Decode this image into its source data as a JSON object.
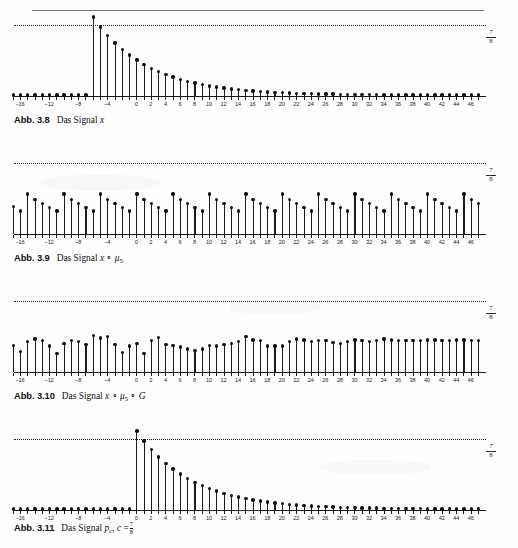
{
  "page": {
    "header_ghost": "",
    "background_color": "#fefefe",
    "ink_color": "#1b1b1b"
  },
  "reference_value_label": {
    "numerator": "7",
    "denominator": "8"
  },
  "figures": [
    {
      "id": "abb-3-8",
      "label": "Abb. 3.8",
      "caption_prefix": "Das Signal",
      "caption_math": "x",
      "caption_full": "Abb. 3.8  Das Signal x"
    },
    {
      "id": "abb-3-9",
      "label": "Abb. 3.9",
      "caption_prefix": "Das Signal",
      "caption_math": "x ∘ μ5",
      "caption_full": "Abb. 3.9  Das Signal x ∘ μ₅"
    },
    {
      "id": "abb-3-10",
      "label": "Abb. 3.10",
      "caption_prefix": "Das Signal",
      "caption_math": "x ∘ μ5 ∘ G",
      "caption_full": "Abb. 3.10  Das Signal x ∘ μ₅ ∘ G"
    },
    {
      "id": "abb-3-11",
      "label": "Abb. 3.11",
      "caption_prefix": "Das Signal",
      "caption_math": "pc, c = 7/8",
      "caption_full": "Abb. 3.11  Das Signal p_c, c = 7/8"
    }
  ],
  "axis": {
    "x_min": -17,
    "x_max": 47,
    "tick_step": 1,
    "labeled_ticks": [
      -16,
      -12,
      -8,
      -4,
      0,
      2,
      4,
      6,
      8,
      10,
      12,
      14,
      16,
      18,
      20,
      22,
      24,
      26,
      28,
      30,
      32,
      34,
      36,
      38,
      40,
      42,
      44,
      46
    ],
    "tick_labels": [
      "−16",
      "−12",
      "−8",
      "−4",
      "0",
      "2",
      "4",
      "6",
      "8",
      "10",
      "12",
      "14",
      "16",
      "18",
      "20",
      "22",
      "24",
      "26",
      "28",
      "30",
      "32",
      "34",
      "36",
      "38",
      "40",
      "42",
      "44",
      "46"
    ],
    "y_max": 0.875,
    "y_reference_line": 0.875
  },
  "chart_data": [
    {
      "type": "line",
      "plot_style": "stem",
      "title": "Abb. 3.8 Das Signal x",
      "xlabel": "",
      "ylabel": "",
      "ylim": [
        0,
        0.875
      ],
      "xlim": [
        -17,
        47
      ],
      "grid": false,
      "legend": "none",
      "annotations": [
        "7/8 reference dotted line"
      ],
      "x": [
        -17,
        -16,
        -15,
        -14,
        -13,
        -12,
        -11,
        -10,
        -9,
        -8,
        -7,
        -6,
        -5,
        -4,
        -3,
        -2,
        -1,
        0,
        1,
        2,
        3,
        4,
        5,
        6,
        7,
        8,
        9,
        10,
        11,
        12,
        13,
        14,
        15,
        16,
        17,
        18,
        19,
        20,
        21,
        22,
        23,
        24,
        25,
        26,
        27,
        28,
        29,
        30,
        31,
        32,
        33,
        34,
        35,
        36,
        37,
        38,
        39,
        40,
        41,
        42,
        43,
        44,
        45,
        46,
        47
      ],
      "values": [
        0,
        0,
        0,
        0,
        0,
        0,
        0,
        0,
        0,
        0,
        0,
        0.875,
        0.766,
        0.67,
        0.586,
        0.513,
        0.449,
        0.393,
        0.344,
        0.301,
        0.263,
        0.23,
        0.201,
        0.176,
        0.154,
        0.135,
        0.118,
        0.103,
        0.09,
        0.079,
        0.069,
        0.06,
        0.053,
        0.046,
        0.04,
        0.035,
        0.031,
        0.027,
        0.024,
        0.021,
        0.018,
        0.016,
        0.014,
        0.012,
        0.011,
        0.009,
        0.008,
        0.007,
        0.006,
        0.005,
        0.005,
        0.004,
        0.004,
        0.003,
        0.003,
        0.002,
        0.002,
        0.002,
        0.002,
        0.001,
        0.001,
        0.001,
        0.001,
        0.001,
        0.001
      ]
    },
    {
      "type": "line",
      "plot_style": "stem",
      "title": "Abb. 3.9 Das Signal x ∘ μ₅",
      "xlabel": "",
      "ylabel": "",
      "ylim": [
        0,
        0.875
      ],
      "xlim": [
        -17,
        47
      ],
      "grid": false,
      "legend": "none",
      "annotations": [
        "7/8 reference dotted line",
        "periodic with period 5"
      ],
      "x": [
        -17,
        -16,
        -15,
        -14,
        -13,
        -12,
        -11,
        -10,
        -9,
        -8,
        -7,
        -6,
        -5,
        -4,
        -3,
        -2,
        -1,
        0,
        1,
        2,
        3,
        4,
        5,
        6,
        7,
        8,
        9,
        10,
        11,
        12,
        13,
        14,
        15,
        16,
        17,
        18,
        19,
        20,
        21,
        22,
        23,
        24,
        25,
        26,
        27,
        28,
        29,
        30,
        31,
        32,
        33,
        34,
        35,
        36,
        37,
        38,
        39,
        40,
        41,
        42,
        43,
        44,
        45,
        46,
        47
      ],
      "values": [
        0.3,
        0.25,
        0.44,
        0.38,
        0.33,
        0.29,
        0.25,
        0.44,
        0.38,
        0.33,
        0.29,
        0.25,
        0.44,
        0.38,
        0.33,
        0.29,
        0.25,
        0.44,
        0.38,
        0.33,
        0.29,
        0.25,
        0.44,
        0.38,
        0.33,
        0.29,
        0.25,
        0.44,
        0.38,
        0.33,
        0.29,
        0.25,
        0.44,
        0.38,
        0.33,
        0.29,
        0.25,
        0.44,
        0.38,
        0.33,
        0.29,
        0.25,
        0.44,
        0.38,
        0.33,
        0.29,
        0.25,
        0.44,
        0.38,
        0.33,
        0.29,
        0.25,
        0.44,
        0.38,
        0.33,
        0.29,
        0.25,
        0.44,
        0.38,
        0.33,
        0.29,
        0.25,
        0.44,
        0.38,
        0.33
      ]
    },
    {
      "type": "line",
      "plot_style": "stem",
      "title": "Abb. 3.10 Das Signal x ∘ μ₅ ∘ G",
      "xlabel": "",
      "ylabel": "",
      "ylim": [
        0,
        0.875
      ],
      "xlim": [
        -17,
        47
      ],
      "grid": false,
      "legend": "none",
      "annotations": [
        "7/8 reference dotted line",
        "quasi-random modulated pattern"
      ],
      "x": [
        -17,
        -16,
        -15,
        -14,
        -13,
        -12,
        -11,
        -10,
        -9,
        -8,
        -7,
        -6,
        -5,
        -4,
        -3,
        -2,
        -1,
        0,
        1,
        2,
        3,
        4,
        5,
        6,
        7,
        8,
        9,
        10,
        11,
        12,
        13,
        14,
        15,
        16,
        17,
        18,
        19,
        20,
        21,
        22,
        23,
        24,
        25,
        26,
        27,
        28,
        29,
        30,
        31,
        32,
        33,
        34,
        35,
        36,
        37,
        38,
        39,
        40,
        41,
        42,
        43,
        44,
        45,
        46,
        47
      ],
      "values": [
        0.29,
        0.22,
        0.33,
        0.36,
        0.34,
        0.28,
        0.2,
        0.31,
        0.34,
        0.33,
        0.3,
        0.4,
        0.37,
        0.39,
        0.3,
        0.21,
        0.28,
        0.31,
        0.2,
        0.34,
        0.38,
        0.3,
        0.29,
        0.27,
        0.25,
        0.23,
        0.25,
        0.29,
        0.28,
        0.3,
        0.31,
        0.33,
        0.39,
        0.35,
        0.34,
        0.28,
        0.28,
        0.28,
        0.33,
        0.36,
        0.35,
        0.33,
        0.34,
        0.34,
        0.32,
        0.31,
        0.33,
        0.35,
        0.34,
        0.33,
        0.34,
        0.36,
        0.35,
        0.34,
        0.34,
        0.34,
        0.34,
        0.35,
        0.35,
        0.34,
        0.34,
        0.35,
        0.35,
        0.34,
        0.34
      ]
    },
    {
      "type": "line",
      "plot_style": "stem",
      "title": "Abb. 3.11 Das Signal p_c, c = 7/8",
      "xlabel": "",
      "ylabel": "",
      "ylim": [
        0,
        0.875
      ],
      "xlim": [
        -17,
        47
      ],
      "grid": false,
      "legend": "none",
      "annotations": [
        "7/8 reference dotted line",
        "causal geometric decay starting at 0"
      ],
      "x": [
        -17,
        -16,
        -15,
        -14,
        -13,
        -12,
        -11,
        -10,
        -9,
        -8,
        -7,
        -6,
        -5,
        -4,
        -3,
        -2,
        -1,
        0,
        1,
        2,
        3,
        4,
        5,
        6,
        7,
        8,
        9,
        10,
        11,
        12,
        13,
        14,
        15,
        16,
        17,
        18,
        19,
        20,
        21,
        22,
        23,
        24,
        25,
        26,
        27,
        28,
        29,
        30,
        31,
        32,
        33,
        34,
        35,
        36,
        37,
        38,
        39,
        40,
        41,
        42,
        43,
        44,
        45,
        46,
        47
      ],
      "values": [
        0,
        0,
        0,
        0,
        0,
        0,
        0,
        0,
        0,
        0,
        0,
        0,
        0,
        0,
        0,
        0,
        0,
        0.875,
        0.766,
        0.67,
        0.586,
        0.513,
        0.449,
        0.393,
        0.344,
        0.301,
        0.263,
        0.23,
        0.201,
        0.176,
        0.154,
        0.135,
        0.118,
        0.103,
        0.09,
        0.079,
        0.069,
        0.06,
        0.053,
        0.046,
        0.04,
        0.035,
        0.031,
        0.027,
        0.024,
        0.021,
        0.018,
        0.016,
        0.014,
        0.012,
        0.011,
        0.009,
        0.008,
        0.007,
        0.006,
        0.005,
        0.005,
        0.004,
        0.004,
        0.003,
        0.003,
        0.002,
        0.002,
        0.002,
        0.002
      ]
    }
  ]
}
